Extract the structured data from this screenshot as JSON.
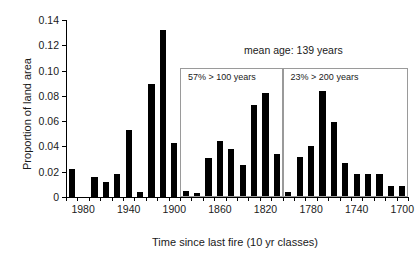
{
  "chart_data": {
    "type": "bar",
    "title": "",
    "xlabel": "Time since last fire (10 yr classes)",
    "ylabel": "Proportion of land area",
    "ylim": [
      0,
      0.14
    ],
    "ytick_labels": [
      "0",
      "0.02",
      "0.04",
      "0.06",
      "0.08",
      "0.10",
      "0.12",
      "0.14"
    ],
    "ytick_values": [
      0,
      0.02,
      0.04,
      0.06,
      0.08,
      0.1,
      0.12,
      0.14
    ],
    "xtick_labels": [
      "1980",
      "1940",
      "1900",
      "1860",
      "1820",
      "1780",
      "1740",
      "1700"
    ],
    "xtick_values": [
      1980,
      1940,
      1900,
      1860,
      1820,
      1780,
      1740,
      1700
    ],
    "x_axis_reversed": true,
    "grid": false,
    "legend": "none",
    "bar_color": "#000000",
    "categories": [
      1990,
      1980,
      1970,
      1960,
      1950,
      1940,
      1930,
      1920,
      1910,
      1900,
      1890,
      1880,
      1870,
      1860,
      1850,
      1840,
      1830,
      1820,
      1810,
      1800,
      1790,
      1780,
      1770,
      1760,
      1750,
      1740,
      1730,
      1720,
      1710,
      1700
    ],
    "values": [
      0.022,
      0.0,
      0.016,
      0.012,
      0.018,
      0.053,
      0.004,
      0.089,
      0.132,
      0.043,
      0.005,
      0.003,
      0.031,
      0.044,
      0.038,
      0.025,
      0.073,
      0.082,
      0.034,
      0.004,
      0.032,
      0.04,
      0.084,
      0.059,
      0.027,
      0.018,
      0.018,
      0.018,
      0.009,
      0.009
    ],
    "annotations": [
      {
        "name": "mean-age",
        "text": "mean age: 139 years"
      },
      {
        "name": "box-100-years",
        "text": "57% > 100 years"
      },
      {
        "name": "box-200-years",
        "text": "23% > 200 years"
      }
    ]
  },
  "axes": {
    "ylabel": "Proportion of land area",
    "xlabel": "Time since last fire (10 yr classes)"
  },
  "annotations": {
    "mean_age": "mean age: 139 years",
    "box_left": "57% > 100 years",
    "box_right": "23% > 200 years"
  }
}
